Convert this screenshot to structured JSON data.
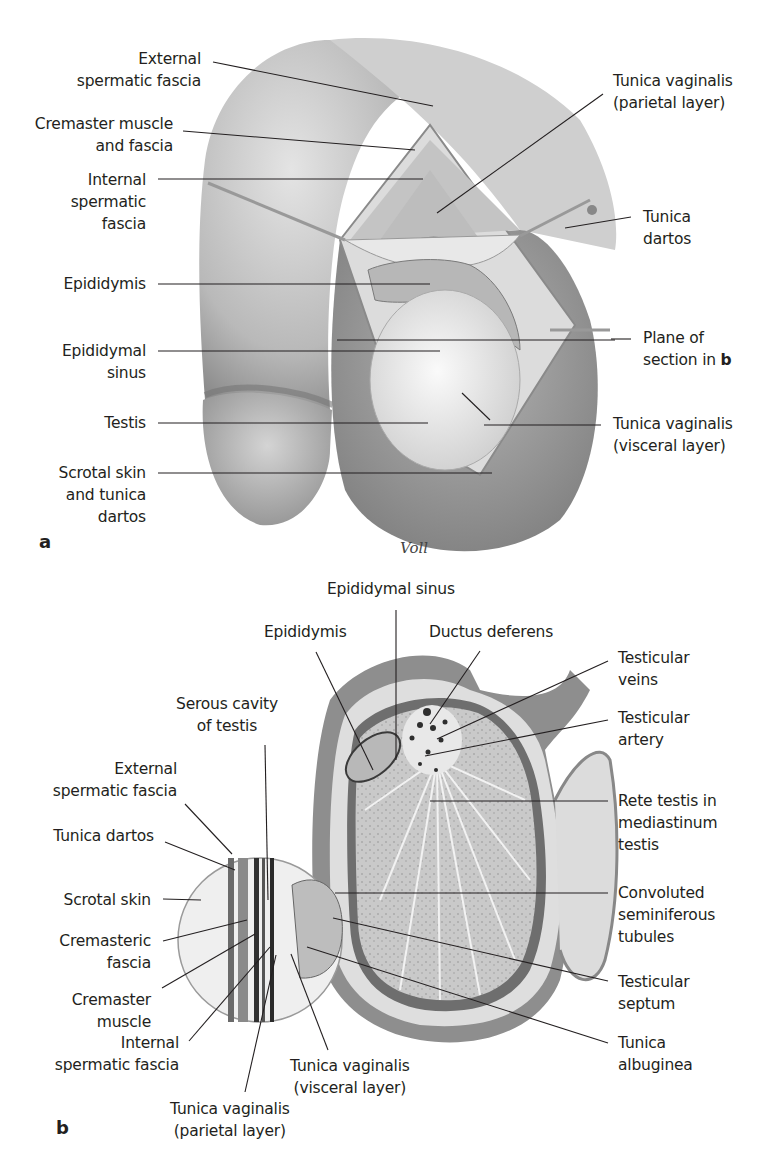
{
  "figure": {
    "panel_a": {
      "letter": "a",
      "signature": "Voll",
      "labels": {
        "external_spermatic_fascia": [
          "External",
          "spermatic fascia"
        ],
        "cremaster_muscle_fascia": [
          "Cremaster muscle",
          "and fascia"
        ],
        "internal_spermatic_fascia": [
          "Internal",
          "spermatic",
          "fascia"
        ],
        "epididymis": [
          "Epididymis"
        ],
        "epididymal_sinus": [
          "Epididymal",
          "sinus"
        ],
        "testis": [
          "Testis"
        ],
        "scrotal_skin_dartos": [
          "Scrotal skin",
          "and tunica",
          "dartos"
        ],
        "tv_parietal": [
          "Tunica vaginalis",
          "(parietal layer)"
        ],
        "tunica_dartos": [
          "Tunica",
          "dartos"
        ],
        "plane_of_section": [
          "Plane of",
          "section in "
        ],
        "plane_of_section_ref": "b",
        "tv_visceral": [
          "Tunica vaginalis",
          "(visceral layer)"
        ]
      }
    },
    "panel_b": {
      "letter": "b",
      "labels": {
        "epididymal_sinus": [
          "Epididymal sinus"
        ],
        "epididymis": [
          "Epididymis"
        ],
        "ductus_deferens": [
          "Ductus deferens"
        ],
        "serous_cavity": [
          "Serous cavity",
          "of testis"
        ],
        "external_spermatic_fascia": [
          "External",
          "spermatic fascia"
        ],
        "tunica_dartos": [
          "Tunica dartos"
        ],
        "scrotal_skin": [
          "Scrotal skin"
        ],
        "cremasteric_fascia": [
          "Cremasteric",
          "fascia"
        ],
        "cremaster_muscle": [
          "Cremaster",
          "muscle"
        ],
        "internal_spermatic_fascia": [
          "Internal",
          "spermatic fascia"
        ],
        "tv_parietal": [
          "Tunica vaginalis",
          "(parietal layer)"
        ],
        "tv_visceral": [
          "Tunica vaginalis",
          "(visceral layer)"
        ],
        "testicular_veins": [
          "Testicular",
          "veins"
        ],
        "testicular_artery": [
          "Testicular",
          "artery"
        ],
        "rete_testis": [
          "Rete testis in",
          "mediastinum",
          "testis"
        ],
        "seminiferous_tubules": [
          "Convoluted",
          "seminiferous",
          "tubules"
        ],
        "testicular_septum": [
          "Testicular",
          "septum"
        ],
        "tunica_albuginea": [
          "Tunica",
          "albuginea"
        ]
      }
    }
  }
}
